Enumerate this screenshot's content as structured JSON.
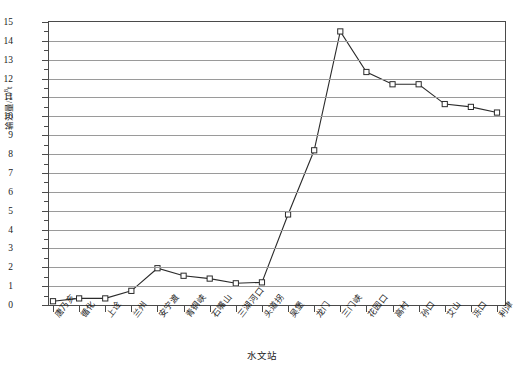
{
  "chart_data": {
    "type": "line",
    "title": "",
    "xlabel": "水文站",
    "ylabel": "输沙量/10⁸t",
    "ylabel_main": "输沙量/10",
    "ylabel_sup": "8",
    "ylabel_unit": "t",
    "ylim": [
      0,
      15
    ],
    "yticks": [
      0,
      1,
      2,
      3,
      4,
      5,
      6,
      7,
      8,
      9,
      10,
      11,
      12,
      13,
      14,
      15
    ],
    "ytick_labels": [
      "0",
      "1",
      "2",
      "3",
      "4",
      "5",
      "6",
      "7",
      "8",
      "9",
      "10",
      "11",
      "12",
      "13",
      "14",
      "15"
    ],
    "grid": true,
    "legend": "none",
    "categories": [
      "唐乃亥",
      "循化",
      "上诠",
      "兰州",
      "安宁渡",
      "青铜峡",
      "石嘴山",
      "三湖河口",
      "头道拐",
      "吴堡",
      "龙门",
      "三门峡",
      "花园口",
      "高村",
      "孙口",
      "艾山",
      "泺口",
      "利津"
    ],
    "values": [
      0.2,
      0.35,
      0.35,
      0.75,
      1.95,
      1.55,
      1.4,
      1.15,
      1.2,
      4.8,
      8.2,
      14.5,
      12.35,
      11.7,
      11.7,
      10.65,
      10.5,
      10.2
    ],
    "marker": "open-square",
    "line_color": "#2b2b2b",
    "marker_color": "#2b2b2b",
    "grid_color": "#9a9a9a",
    "axis_color": "#4a4a4a"
  }
}
